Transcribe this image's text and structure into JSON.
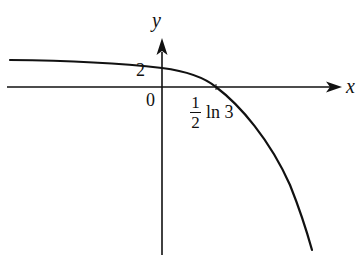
{
  "figure": {
    "type": "function-graph",
    "axes": {
      "x_label": "x",
      "y_label": "y",
      "origin_label": "0"
    },
    "annotations": {
      "y_intercept_label": "2",
      "x_intercept_numerator": "1",
      "x_intercept_denominator": "2",
      "x_intercept_suffix": "ln 3"
    },
    "curve": {
      "description": "Decreasing concave-down curve, nearly flat on the left, crossing y-axis at 2 and x-axis at (1/2) ln 3, plunging downward to the right",
      "y_intercept": 2,
      "x_intercept": "(1/2) ln 3"
    },
    "colors": {
      "stroke": "#111111",
      "background": "#ffffff"
    }
  }
}
